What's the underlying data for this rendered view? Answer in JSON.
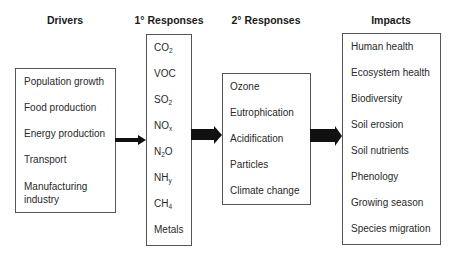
{
  "diagram": {
    "columns": [
      {
        "id": "drivers",
        "title": "Drivers",
        "items": [
          "Population growth",
          "Food production",
          "Energy production",
          "Transport",
          "Manufacturing\nindustry"
        ]
      },
      {
        "id": "primary",
        "title": "1° Responses",
        "items": [
          {
            "base": "CO",
            "sub": "2",
            "after": ""
          },
          {
            "base": "VOC",
            "sub": "",
            "after": ""
          },
          {
            "base": "SO",
            "sub": "2",
            "after": ""
          },
          {
            "base": "NO",
            "sub": "x",
            "after": ""
          },
          {
            "base": "N",
            "sub": "2",
            "after": "O"
          },
          {
            "base": "NH",
            "sub": "y",
            "after": ""
          },
          {
            "base": "CH",
            "sub": "4",
            "after": ""
          },
          {
            "base": "Metals",
            "sub": "",
            "after": ""
          }
        ]
      },
      {
        "id": "secondary",
        "title": "2° Responses",
        "items": [
          "Ozone",
          "Eutrophication",
          "Acidification",
          "Particles",
          "Climate change"
        ]
      },
      {
        "id": "impacts",
        "title": "Impacts",
        "items": [
          "Human health",
          "Ecosystem health",
          "Biodiversity",
          "Soil erosion",
          "Soil nutrients",
          "Phenology",
          "Growing season",
          "Species migration"
        ]
      }
    ],
    "arrows": [
      {
        "from": "drivers",
        "to": "primary"
      },
      {
        "from": "primary",
        "to": "secondary"
      },
      {
        "from": "secondary",
        "to": "impacts"
      }
    ]
  }
}
